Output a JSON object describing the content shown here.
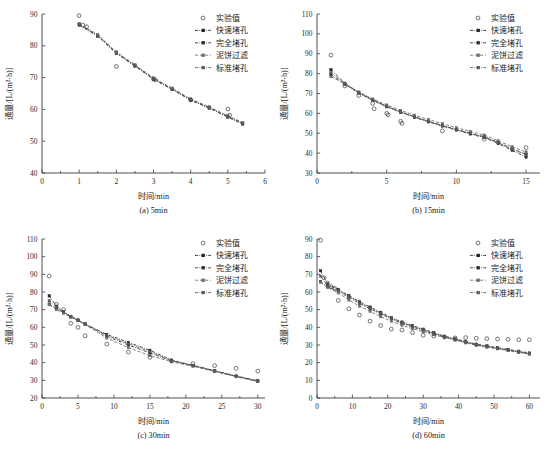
{
  "figure": {
    "axis_x_title": "时间/min",
    "axis_y_title": "通量/[L/(m²·h)]",
    "legend": [
      {
        "label": "实验值",
        "style": "open-circle",
        "color": "#4a4a4a"
      },
      {
        "label": "快速堵孔",
        "style": "dashdot-square",
        "color": "#1f1f1f"
      },
      {
        "label": "完全堵孔",
        "style": "dashdot-square",
        "color": "#2b2b2b"
      },
      {
        "label": "泥饼过滤",
        "style": "dashed-square",
        "color": "#6e6e6e"
      },
      {
        "label": "标准堵孔",
        "style": "dashdot-square",
        "color": "#5a5a5a"
      }
    ]
  },
  "chart_data": [
    {
      "type": "scatter",
      "panel": "a",
      "caption": "(a) 5min",
      "title": "",
      "xlabel": "时间/min",
      "ylabel": "通量/[L/(m²·h)]",
      "xlim": [
        0,
        6
      ],
      "ylim": [
        40,
        90
      ],
      "xticks": [
        0,
        1,
        2,
        3,
        4,
        5,
        6
      ],
      "yticks": [
        40,
        50,
        60,
        70,
        80,
        90
      ],
      "grid": false,
      "legend_position": "top-right",
      "experimental": {
        "name": "实验值",
        "x": [
          1.0,
          1.1,
          1.2,
          2.0,
          3.0,
          3.05,
          4.0,
          5.0,
          5.05
        ],
        "y": [
          89.5,
          86.5,
          86.0,
          73.5,
          69.5,
          69.3,
          63.0,
          60.1,
          58.2
        ]
      },
      "series": [
        {
          "name": "快速堵孔",
          "x": [
            1.0,
            1.5,
            2.0,
            2.5,
            3.0,
            3.5,
            4.0,
            4.5,
            5.0,
            5.4
          ],
          "y": [
            86.8,
            83.2,
            77.8,
            73.8,
            69.6,
            66.4,
            63.0,
            60.5,
            57.7,
            55.6
          ]
        },
        {
          "name": "完全堵孔",
          "x": [
            1.0,
            1.5,
            2.0,
            2.5,
            3.0,
            3.5,
            4.0,
            4.5,
            5.0,
            5.4
          ],
          "y": [
            86.5,
            83.0,
            77.6,
            73.6,
            69.5,
            66.3,
            62.9,
            60.4,
            57.6,
            55.4
          ]
        },
        {
          "name": "泥饼过滤",
          "x": [
            1.0,
            1.5,
            2.0,
            2.5,
            3.0,
            3.5,
            4.0,
            4.5,
            5.0,
            5.4
          ],
          "y": [
            87.0,
            83.5,
            78.1,
            74.1,
            69.9,
            66.7,
            63.3,
            60.8,
            58.0,
            55.9
          ]
        },
        {
          "name": "标准堵孔",
          "x": [
            1.0,
            1.5,
            2.0,
            2.5,
            3.0,
            3.5,
            4.0,
            4.5,
            5.0,
            5.4
          ],
          "y": [
            86.7,
            83.1,
            77.7,
            73.7,
            69.6,
            66.4,
            63.0,
            60.5,
            57.7,
            55.5
          ]
        }
      ]
    },
    {
      "type": "scatter",
      "panel": "b",
      "caption": "(b) 15min",
      "title": "",
      "xlabel": "时间/min",
      "ylabel": "通量/[L/(m²·h)]",
      "xlim": [
        0,
        16
      ],
      "ylim": [
        30,
        110
      ],
      "xticks": [
        0,
        5,
        10,
        15
      ],
      "yticks": [
        30,
        40,
        50,
        60,
        70,
        80,
        90,
        100,
        110
      ],
      "grid": false,
      "legend_position": "top-right",
      "experimental": {
        "name": "实验值",
        "x": [
          1,
          2,
          3,
          4,
          4.1,
          5,
          5.1,
          6,
          6.1,
          9,
          12,
          15
        ],
        "y": [
          89.3,
          73.8,
          69.0,
          65.0,
          62.3,
          60.0,
          59.3,
          56.0,
          55.0,
          51.2,
          47.0,
          42.8
        ]
      },
      "series": [
        {
          "name": "快速堵孔",
          "x": [
            1,
            2,
            3,
            4,
            5,
            6,
            7,
            8,
            9,
            10,
            11,
            12,
            13,
            14,
            15
          ],
          "y": [
            82.0,
            75.2,
            70.5,
            66.8,
            63.6,
            60.8,
            58.3,
            56.0,
            53.9,
            51.9,
            50.0,
            48.2,
            45.4,
            42.2,
            39.4
          ]
        },
        {
          "name": "完全堵孔",
          "x": [
            1,
            2,
            3,
            4,
            5,
            6,
            7,
            8,
            9,
            10,
            11,
            12,
            13,
            14,
            15
          ],
          "y": [
            79.5,
            74.6,
            70.2,
            66.5,
            63.3,
            60.5,
            58.0,
            55.7,
            53.6,
            51.6,
            49.6,
            47.8,
            44.8,
            41.4,
            38.0
          ]
        },
        {
          "name": "泥饼过滤",
          "x": [
            1,
            2,
            3,
            4,
            5,
            6,
            7,
            8,
            9,
            10,
            11,
            12,
            13,
            14,
            15
          ],
          "y": [
            78.5,
            74.8,
            70.8,
            67.2,
            64.2,
            61.5,
            59.1,
            56.9,
            54.8,
            52.8,
            50.9,
            49.1,
            46.2,
            43.2,
            40.6
          ]
        },
        {
          "name": "标准堵孔",
          "x": [
            1,
            2,
            3,
            4,
            5,
            6,
            7,
            8,
            9,
            10,
            11,
            12,
            13,
            14,
            15
          ],
          "y": [
            80.5,
            75.0,
            70.4,
            66.7,
            63.5,
            60.7,
            58.2,
            55.9,
            53.8,
            51.8,
            49.9,
            48.1,
            45.2,
            42.0,
            39.2
          ]
        }
      ]
    },
    {
      "type": "scatter",
      "panel": "c",
      "caption": "(c) 30min",
      "title": "",
      "xlabel": "时间/min",
      "ylabel": "通量/[L/(m²·h)]",
      "xlim": [
        0,
        31
      ],
      "ylim": [
        20,
        110
      ],
      "xticks": [
        0,
        5,
        10,
        15,
        20,
        25,
        30
      ],
      "yticks": [
        20,
        30,
        40,
        50,
        60,
        70,
        80,
        90,
        100,
        110
      ],
      "grid": false,
      "legend_position": "top-right",
      "experimental": {
        "name": "实验值",
        "x": [
          1,
          2,
          3,
          4,
          5,
          6,
          9,
          12,
          15,
          18,
          21,
          24,
          27,
          30
        ],
        "y": [
          89.0,
          73.0,
          70.0,
          62.3,
          60.0,
          55.2,
          50.5,
          46.0,
          43.0,
          41.0,
          39.5,
          38.3,
          36.8,
          35.2
        ]
      },
      "series": [
        {
          "name": "快速堵孔",
          "x": [
            1,
            2,
            3,
            4,
            5,
            6,
            9,
            12,
            15,
            18,
            21,
            24,
            27,
            30
          ],
          "y": [
            77.8,
            72.0,
            69.0,
            66.0,
            64.0,
            61.8,
            56.0,
            51.5,
            47.0,
            41.5,
            38.5,
            35.5,
            32.5,
            29.8
          ]
        },
        {
          "name": "完全堵孔",
          "x": [
            1,
            2,
            3,
            4,
            5,
            6,
            9,
            12,
            15,
            18,
            21,
            24,
            27,
            30
          ],
          "y": [
            73.2,
            70.5,
            68.5,
            66.2,
            64.2,
            62.0,
            55.0,
            50.0,
            45.5,
            41.0,
            38.2,
            35.2,
            32.2,
            29.5
          ]
        },
        {
          "name": "泥饼过滤",
          "x": [
            1,
            2,
            3,
            4,
            5,
            6,
            9,
            12,
            15,
            18,
            21,
            24,
            27,
            30
          ],
          "y": [
            72.8,
            70.0,
            68.0,
            65.8,
            63.8,
            61.5,
            54.0,
            48.5,
            44.0,
            40.5,
            38.0,
            35.0,
            32.0,
            29.3
          ]
        },
        {
          "name": "标准堵孔",
          "x": [
            1,
            2,
            3,
            4,
            5,
            6,
            9,
            12,
            15,
            18,
            21,
            24,
            27,
            30
          ],
          "y": [
            75.0,
            71.2,
            68.8,
            66.0,
            64.0,
            61.6,
            55.5,
            50.8,
            46.2,
            41.2,
            38.3,
            35.3,
            32.3,
            29.6
          ]
        }
      ]
    },
    {
      "type": "scatter",
      "panel": "d",
      "caption": "(d) 60min",
      "title": "",
      "xlabel": "时间/min",
      "ylabel": "通量/[L/(m²·h)]",
      "xlim": [
        0,
        63
      ],
      "ylim": [
        0,
        90
      ],
      "xticks": [
        0,
        10,
        20,
        30,
        40,
        50,
        60
      ],
      "yticks": [
        0,
        10,
        20,
        30,
        40,
        50,
        60,
        70,
        80,
        90
      ],
      "grid": false,
      "legend_position": "top-right",
      "experimental": {
        "name": "实验值",
        "x": [
          1,
          2,
          3,
          4,
          5,
          6,
          9,
          12,
          15,
          18,
          21,
          24,
          27,
          30,
          33,
          36,
          39,
          42,
          45,
          48,
          51,
          54,
          57,
          60
        ],
        "y": [
          89.3,
          68.0,
          65.0,
          63.0,
          62.0,
          55.2,
          50.5,
          47.0,
          43.5,
          41.0,
          39.0,
          38.5,
          37.0,
          35.5,
          35.0,
          34.5,
          34.0,
          34.2,
          33.8,
          33.6,
          33.4,
          33.2,
          33.0,
          33.0
        ]
      },
      "series": [
        {
          "name": "快速堵孔",
          "x": [
            1,
            3,
            6,
            9,
            12,
            15,
            18,
            21,
            24,
            27,
            30,
            33,
            36,
            39,
            42,
            45,
            48,
            51,
            54,
            57,
            60
          ],
          "y": [
            72.0,
            64.5,
            61.5,
            58.0,
            54.5,
            51.5,
            48.5,
            45.5,
            43.0,
            41.0,
            39.0,
            37.0,
            35.0,
            33.5,
            32.0,
            30.5,
            29.5,
            28.5,
            27.5,
            26.5,
            25.5
          ]
        },
        {
          "name": "完全堵孔",
          "x": [
            1,
            3,
            6,
            9,
            12,
            15,
            18,
            21,
            24,
            27,
            30,
            33,
            36,
            39,
            42,
            45,
            48,
            51,
            54,
            57,
            60
          ],
          "y": [
            66.0,
            63.0,
            60.5,
            57.0,
            53.5,
            50.5,
            47.5,
            44.8,
            42.2,
            40.2,
            38.2,
            36.3,
            34.5,
            33.0,
            31.5,
            30.0,
            29.0,
            28.0,
            27.0,
            26.0,
            25.0
          ]
        },
        {
          "name": "泥饼过滤",
          "x": [
            1,
            3,
            6,
            9,
            12,
            15,
            18,
            21,
            24,
            27,
            30,
            33,
            36,
            39,
            42,
            45,
            48,
            51,
            54,
            57,
            60
          ],
          "y": [
            65.5,
            62.5,
            59.5,
            55.5,
            52.0,
            49.0,
            46.0,
            43.5,
            41.2,
            39.2,
            37.5,
            35.8,
            34.2,
            32.8,
            31.2,
            29.8,
            28.8,
            27.8,
            26.8,
            25.8,
            24.8
          ]
        },
        {
          "name": "标准堵孔",
          "x": [
            1,
            3,
            6,
            9,
            12,
            15,
            18,
            21,
            24,
            27,
            30,
            33,
            36,
            39,
            42,
            45,
            48,
            51,
            54,
            57,
            60
          ],
          "y": [
            69.0,
            63.8,
            61.0,
            57.5,
            54.0,
            51.0,
            48.0,
            45.2,
            42.6,
            40.6,
            38.6,
            36.6,
            34.8,
            33.2,
            31.8,
            30.2,
            29.2,
            28.2,
            27.2,
            26.2,
            25.2
          ]
        }
      ]
    }
  ]
}
